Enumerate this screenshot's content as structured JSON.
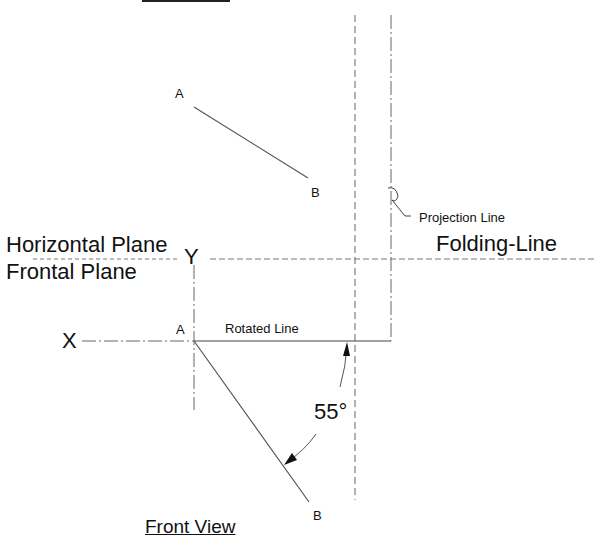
{
  "diagram": {
    "title_top": "Top View",
    "title_bottom": "Front View",
    "plane_upper": "Horizontal Plane",
    "plane_lower": "Frontal Plane",
    "folding_line_label": "Folding-Line",
    "projection_line_label": "Projection Line",
    "rotated_line_label": "Rotated Line",
    "angle_label": "55°",
    "axis_x": "X",
    "axis_y": "Y",
    "top_view_points": {
      "a": "A",
      "b": "B"
    },
    "front_view_points": {
      "a": "A",
      "b": "B"
    },
    "line_color": "#555555",
    "construction_line_color": "#666666"
  }
}
